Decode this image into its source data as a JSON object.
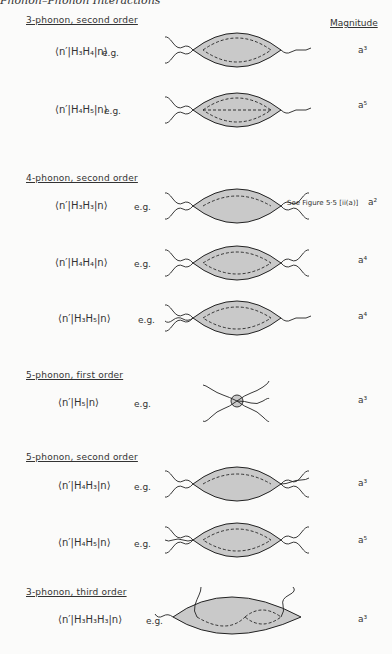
{
  "running_head": "Phonon–Phonon Interactions",
  "magnitude_header": "Magnitude",
  "sections": [
    {
      "title": "3-phonon, second order",
      "top": 15
    },
    {
      "title": "4-phonon, second order",
      "top": 173
    },
    {
      "title": "5-phonon, first order",
      "top": 370
    },
    {
      "title": "5-phonon, second order",
      "top": 452
    },
    {
      "title": "3-phonon, third order",
      "top": 587
    }
  ],
  "rows": [
    {
      "matrix": "⟨n′|H₃H₄|n⟩",
      "eg": "e.g.",
      "magnitude": "a³"
    },
    {
      "matrix": "⟨n′|H₄H₅|n⟩",
      "eg": "e.g.",
      "magnitude": "a⁵"
    },
    {
      "matrix": "⟨n′|H₃H₃|n⟩",
      "eg": "e.g.",
      "magnitude": "a²",
      "note": "See Figure 5·5 [ii(a)]"
    },
    {
      "matrix": "⟨n′|H₄H₄|n⟩",
      "eg": "e.g.",
      "magnitude": "a⁴"
    },
    {
      "matrix": "⟨n′|H₃H₅|n⟩",
      "eg": "e.g.",
      "magnitude": "a⁴"
    },
    {
      "matrix": "⟨n′|H₅|n⟩",
      "eg": "e.g.",
      "magnitude": "a³"
    },
    {
      "matrix": "⟨n′|H₄H₃|n⟩",
      "eg": "e.g.",
      "magnitude": "a³"
    },
    {
      "matrix": "⟨n′|H₄H₅|n⟩",
      "eg": "e.g.",
      "magnitude": "a⁵"
    },
    {
      "matrix": "⟨n′|H₃H₃H₃|n⟩",
      "eg": "e.g.",
      "magnitude": "a³"
    }
  ],
  "colors": {
    "shade": "#c9c9c9",
    "ink": "#222222"
  }
}
